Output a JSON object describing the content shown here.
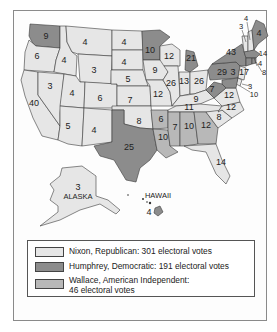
{
  "map": {
    "title": "1968 U.S. Presidential Election Results by State",
    "colors": {
      "nixon": "#e6e6e6",
      "humphrey": "#8c8c8c",
      "wallace": "#b8b8b8"
    },
    "states": [
      {
        "name": "Washington",
        "votes": "9",
        "winner": "humphrey"
      },
      {
        "name": "Oregon",
        "votes": "6",
        "winner": "nixon"
      },
      {
        "name": "California",
        "votes": "40",
        "winner": "nixon"
      },
      {
        "name": "Idaho",
        "votes": "4",
        "winner": "nixon"
      },
      {
        "name": "Nevada",
        "votes": "3",
        "winner": "nixon"
      },
      {
        "name": "Montana",
        "votes": "4",
        "winner": "nixon"
      },
      {
        "name": "Wyoming",
        "votes": "3",
        "winner": "nixon"
      },
      {
        "name": "Utah",
        "votes": "4",
        "winner": "nixon"
      },
      {
        "name": "Arizona",
        "votes": "5",
        "winner": "nixon"
      },
      {
        "name": "Colorado",
        "votes": "6",
        "winner": "nixon"
      },
      {
        "name": "New Mexico",
        "votes": "4",
        "winner": "nixon"
      },
      {
        "name": "North Dakota",
        "votes": "4",
        "winner": "nixon"
      },
      {
        "name": "South Dakota",
        "votes": "4",
        "winner": "nixon"
      },
      {
        "name": "Nebraska",
        "votes": "5",
        "winner": "nixon"
      },
      {
        "name": "Kansas",
        "votes": "7",
        "winner": "nixon"
      },
      {
        "name": "Oklahoma",
        "votes": "8",
        "winner": "nixon"
      },
      {
        "name": "Texas",
        "votes": "25",
        "winner": "humphrey"
      },
      {
        "name": "Minnesota",
        "votes": "10",
        "winner": "humphrey"
      },
      {
        "name": "Iowa",
        "votes": "9",
        "winner": "nixon"
      },
      {
        "name": "Missouri",
        "votes": "12",
        "winner": "nixon"
      },
      {
        "name": "Arkansas",
        "votes": "6",
        "winner": "wallace"
      },
      {
        "name": "Louisiana",
        "votes": "10",
        "winner": "wallace"
      },
      {
        "name": "Wisconsin",
        "votes": "12",
        "winner": "nixon"
      },
      {
        "name": "Illinois",
        "votes": "26",
        "winner": "nixon"
      },
      {
        "name": "Michigan",
        "votes": "21",
        "winner": "humphrey"
      },
      {
        "name": "Indiana",
        "votes": "13",
        "winner": "nixon"
      },
      {
        "name": "Ohio",
        "votes": "26",
        "winner": "nixon"
      },
      {
        "name": "Kentucky",
        "votes": "9",
        "winner": "nixon"
      },
      {
        "name": "Tennessee",
        "votes": "11",
        "winner": "nixon"
      },
      {
        "name": "Mississippi",
        "votes": "7",
        "winner": "wallace"
      },
      {
        "name": "Alabama",
        "votes": "10",
        "winner": "wallace"
      },
      {
        "name": "Georgia",
        "votes": "12",
        "winner": "wallace"
      },
      {
        "name": "Florida",
        "votes": "14",
        "winner": "nixon"
      },
      {
        "name": "South Carolina",
        "votes": "8",
        "winner": "nixon"
      },
      {
        "name": "North Carolina",
        "votes": "12",
        "winner": "nixon"
      },
      {
        "name": "Virginia",
        "votes": "12",
        "winner": "nixon"
      },
      {
        "name": "West Virginia",
        "votes": "7",
        "winner": "humphrey"
      },
      {
        "name": "Pennsylvania",
        "votes": "29",
        "winner": "humphrey"
      },
      {
        "name": "New York",
        "votes": "43",
        "winner": "humphrey"
      },
      {
        "name": "New Jersey",
        "votes": "17",
        "winner": "nixon"
      },
      {
        "name": "Delaware",
        "votes": "3",
        "winner": "nixon"
      },
      {
        "name": "Maryland",
        "votes": "10",
        "winner": "humphrey"
      },
      {
        "name": "District of Columbia",
        "votes": "3",
        "winner": "humphrey"
      },
      {
        "name": "Maine",
        "votes": "4",
        "winner": "humphrey"
      },
      {
        "name": "New Hampshire",
        "votes": "4",
        "winner": "nixon"
      },
      {
        "name": "Vermont",
        "votes": "3",
        "winner": "nixon"
      },
      {
        "name": "Massachusetts",
        "votes": "14",
        "winner": "humphrey"
      },
      {
        "name": "Rhode Island",
        "votes": "4",
        "winner": "humphrey"
      },
      {
        "name": "Connecticut",
        "votes": "8",
        "winner": "humphrey"
      },
      {
        "name": "Alaska",
        "votes": "3",
        "winner": "nixon"
      },
      {
        "name": "Hawaii",
        "votes": "4",
        "winner": "humphrey"
      }
    ],
    "labels": {
      "alaska": "ALASKA",
      "hawaii": "HAWAII"
    }
  },
  "legend": {
    "items": [
      {
        "label": "Nixon, Republican: 301 electoral votes",
        "color": "#e6e6e6"
      },
      {
        "label": "Humphrey, Democratic: 191 electoral votes",
        "color": "#8c8c8c"
      },
      {
        "label_line1": "Wallace, American Independent:",
        "label_line2": "46 electoral votes",
        "color": "#b8b8b8"
      }
    ]
  }
}
